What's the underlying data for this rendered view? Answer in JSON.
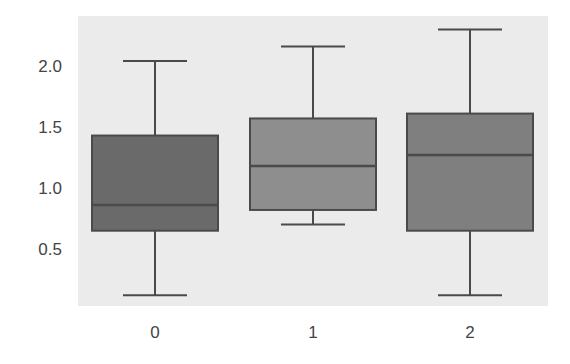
{
  "chart_data": {
    "type": "boxplot",
    "title": "",
    "xlabel": "",
    "ylabel": "",
    "categories": [
      "0",
      "1",
      "2"
    ],
    "ylim": [
      0.0,
      2.37
    ],
    "yticks": [
      "0.5",
      "1.0",
      "1.5",
      "2.0"
    ],
    "ytick_values": [
      0.5,
      1.0,
      1.5,
      2.0
    ],
    "grid": false,
    "series": [
      {
        "name": "0",
        "whisker_low": 0.12,
        "q1": 0.65,
        "median": 0.86,
        "q3": 1.43,
        "whisker_high": 2.04,
        "color": "#6a6a6a"
      },
      {
        "name": "1",
        "whisker_low": 0.7,
        "q1": 0.82,
        "median": 1.18,
        "q3": 1.57,
        "whisker_high": 2.16,
        "color": "#8e8e8e"
      },
      {
        "name": "2",
        "whisker_low": 0.12,
        "q1": 0.65,
        "median": 1.27,
        "q3": 1.61,
        "whisker_high": 2.3,
        "color": "#7f7f7f"
      }
    ]
  },
  "style": {
    "plot_background": "#ebebeb",
    "line_color": "#4a4a4a"
  }
}
